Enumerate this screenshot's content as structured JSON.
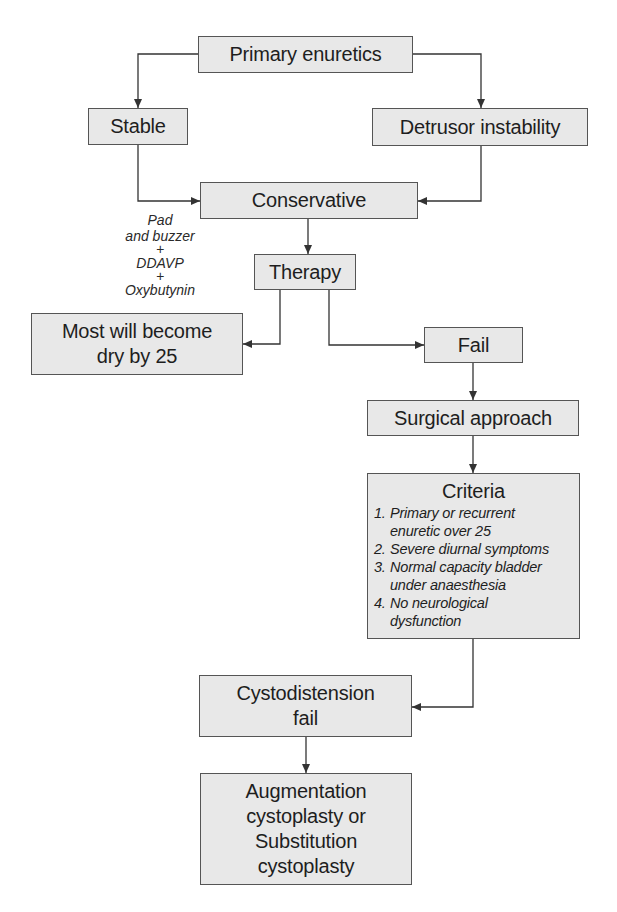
{
  "diagram": {
    "type": "flowchart",
    "nodes": {
      "primary": "Primary enuretics",
      "stable": "Stable",
      "detrusor": "Detrusor instability",
      "conservative": "Conservative",
      "therapy": "Therapy",
      "most_dry": [
        "Most will become",
        "dry by 25"
      ],
      "fail": "Fail",
      "surgical": "Surgical approach",
      "criteria": {
        "title": "Criteria",
        "items": [
          {
            "num": "1.",
            "lines": [
              "Primary or recurrent",
              "enuretic over 25"
            ]
          },
          {
            "num": "2.",
            "lines": [
              "Severe diurnal symptoms"
            ]
          },
          {
            "num": "3.",
            "lines": [
              "Normal capacity bladder",
              "under anaesthesia"
            ]
          },
          {
            "num": "4.",
            "lines": [
              "No neurological",
              "dysfunction"
            ]
          }
        ]
      },
      "cystodistension": [
        "Cystodistension",
        "fail"
      ],
      "augmentation": [
        "Augmentation",
        "cystoplasty or",
        "Substitution",
        "cystoplasty"
      ]
    },
    "therapy_note": [
      "Pad",
      "and buzzer",
      "+",
      "DDAVP",
      "+",
      "Oxybutynin"
    ],
    "edges": [
      [
        "Primary enuretics",
        "Stable"
      ],
      [
        "Primary enuretics",
        "Detrusor instability"
      ],
      [
        "Stable",
        "Conservative"
      ],
      [
        "Detrusor instability",
        "Conservative"
      ],
      [
        "Conservative",
        "Therapy"
      ],
      [
        "Therapy",
        "Most will become dry by 25"
      ],
      [
        "Therapy",
        "Fail"
      ],
      [
        "Fail",
        "Surgical approach"
      ],
      [
        "Surgical approach",
        "Criteria"
      ],
      [
        "Criteria",
        "Cystodistension fail"
      ],
      [
        "Cystodistension fail",
        "Augmentation cystoplasty or Substitution cystoplasty"
      ]
    ],
    "colors": {
      "box_fill": "#e8e8e8",
      "box_border": "#555555",
      "line": "#333333",
      "text": "#1e1e1e"
    }
  }
}
